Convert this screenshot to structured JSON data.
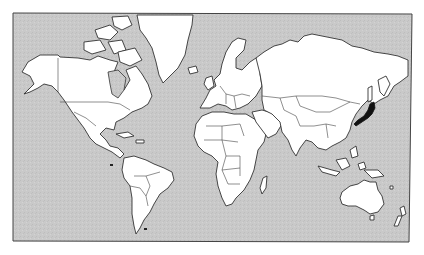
{
  "map": {
    "title": "",
    "projection": "Mercator",
    "colors": {
      "ocean": "#c8c8c8",
      "land": "#ffffff",
      "outline": "#333333",
      "highlight": "#111111",
      "frame": "#444444"
    },
    "frame": {
      "x": 13,
      "y": 13,
      "width": 398,
      "height": 229
    },
    "regions": [
      {
        "name": "North America",
        "highlighted": false
      },
      {
        "name": "Greenland",
        "highlighted": false
      },
      {
        "name": "South America",
        "highlighted": false
      },
      {
        "name": "Europe",
        "highlighted": false
      },
      {
        "name": "Africa",
        "highlighted": false
      },
      {
        "name": "Asia",
        "highlighted": false
      },
      {
        "name": "Japan",
        "highlighted": true
      },
      {
        "name": "Australia",
        "highlighted": false
      },
      {
        "name": "New Zealand",
        "highlighted": false
      },
      {
        "name": "Madagascar",
        "highlighted": false
      }
    ],
    "highlighted_country": "Japan",
    "labels": []
  }
}
